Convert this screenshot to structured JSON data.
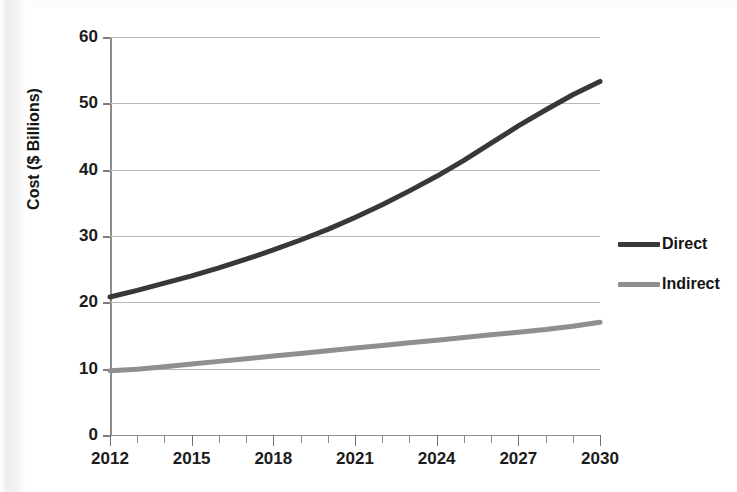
{
  "chart_data": {
    "type": "line",
    "title": "",
    "xlabel": "",
    "ylabel": "Cost ($ Billions)",
    "xlim": [
      2012,
      2030
    ],
    "ylim": [
      0,
      60
    ],
    "grid": true,
    "legend_position": "right",
    "x": [
      2012,
      2013,
      2014,
      2015,
      2016,
      2017,
      2018,
      2019,
      2020,
      2021,
      2022,
      2023,
      2024,
      2025,
      2026,
      2027,
      2028,
      2029,
      2030
    ],
    "x_tick_labels": [
      "2012",
      "2015",
      "2018",
      "2021",
      "2024",
      "2027",
      "2030"
    ],
    "x_tick_values": [
      2012,
      2015,
      2018,
      2021,
      2024,
      2027,
      2030
    ],
    "x_minor_ticks": [
      2012,
      2013,
      2014,
      2015,
      2016,
      2017,
      2018,
      2019,
      2020,
      2021,
      2022,
      2023,
      2024,
      2025,
      2026,
      2027,
      2028,
      2029,
      2030
    ],
    "y_tick_labels": [
      "60",
      "50",
      "40",
      "30",
      "20",
      "10",
      "0"
    ],
    "y_tick_values": [
      60,
      50,
      40,
      30,
      20,
      10,
      0
    ],
    "series": [
      {
        "name": "Direct",
        "color": "#383838",
        "linewidth": 5,
        "values": [
          20.8,
          21.8,
          22.9,
          24.0,
          25.2,
          26.5,
          27.9,
          29.4,
          31.0,
          32.8,
          34.7,
          36.8,
          39.0,
          41.4,
          44.0,
          46.6,
          49.0,
          51.3,
          53.3
        ]
      },
      {
        "name": "Indirect",
        "color": "#8f8f8f",
        "linewidth": 5,
        "values": [
          9.7,
          9.9,
          10.3,
          10.7,
          11.1,
          11.5,
          11.9,
          12.3,
          12.7,
          13.1,
          13.5,
          13.9,
          14.3,
          14.7,
          15.1,
          15.5,
          15.9,
          16.4,
          17.0
        ]
      }
    ]
  },
  "legend": {
    "items": [
      {
        "label": "Direct",
        "color": "#383838"
      },
      {
        "label": "Indirect",
        "color": "#8f8f8f"
      }
    ]
  },
  "axes": {
    "y_title": "Cost ($ Billions)"
  },
  "colors": {
    "grid": "#b9b9b9",
    "axis": "#8c8c8c",
    "text": "#1b1b1b",
    "background": "#ffffff",
    "direct": "#383838",
    "indirect": "#8f8f8f"
  }
}
